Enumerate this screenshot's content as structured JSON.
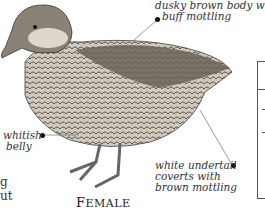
{
  "illustration": {
    "subject": "duck-female",
    "caption_first": "F",
    "caption_rest": "EMALE"
  },
  "annotations": [
    {
      "id": "body",
      "lines": [
        "dusky brown body with",
        "buff mottling"
      ]
    },
    {
      "id": "belly",
      "lines": [
        "whitish",
        "belly"
      ]
    },
    {
      "id": "undertail",
      "lines": [
        "white undertail",
        "coverts with",
        "brown mottling"
      ]
    }
  ],
  "left_fragment": [
    "g",
    "ut"
  ]
}
